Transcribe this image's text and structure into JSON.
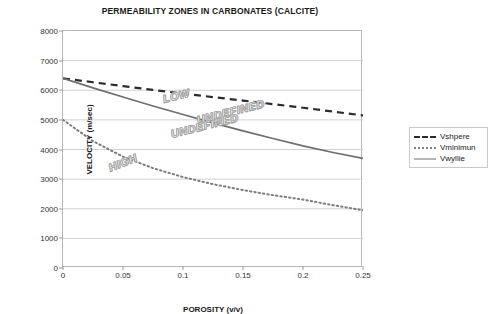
{
  "chart_data": {
    "type": "line",
    "title": "PERMEABILITY ZONES IN CARBONATES (CALCITE)",
    "xlabel": "POROSITY (v/v)",
    "ylabel": "VELOCITY (m/sec)",
    "xlim": [
      0,
      0.25
    ],
    "ylim": [
      0,
      8000
    ],
    "grid": "horizontal",
    "legend_position": "right-outside",
    "xticks": [
      "0",
      "0.05",
      "0.1",
      "0.15",
      "0.2",
      "0.25"
    ],
    "xtick_values": [
      0,
      0.05,
      0.1,
      0.15,
      0.2,
      0.25
    ],
    "yticks": [
      "0",
      "1000",
      "2000",
      "3000",
      "4000",
      "5000",
      "6000",
      "7000",
      "8000"
    ],
    "ytick_values": [
      0,
      1000,
      2000,
      3000,
      4000,
      5000,
      6000,
      7000,
      8000
    ],
    "x": [
      0,
      0.025,
      0.05,
      0.075,
      0.1,
      0.125,
      0.15,
      0.175,
      0.2,
      0.225,
      0.25
    ],
    "series": [
      {
        "name": "Vshpere",
        "style": "dashed",
        "color": "#2b2b2b",
        "values": [
          6400,
          6270,
          6140,
          6010,
          5890,
          5770,
          5650,
          5530,
          5410,
          5280,
          5150
        ]
      },
      {
        "name": "Vminimun",
        "style": "dotted",
        "color": "#7d7d7d",
        "values": [
          5000,
          4280,
          3760,
          3370,
          3070,
          2830,
          2630,
          2460,
          2310,
          2120,
          1950
        ]
      },
      {
        "name": "Vwyllie",
        "style": "solid",
        "color": "#6e6e6e",
        "values": [
          6400,
          6080,
          5770,
          5470,
          5180,
          4900,
          4630,
          4370,
          4120,
          3900,
          3700
        ]
      }
    ],
    "annotations": [
      {
        "text": "LOW",
        "x": 0.083,
        "y": 5720,
        "rotation": -14
      },
      {
        "text": "UNDEFINED",
        "x": 0.112,
        "y": 4980,
        "rotation": -14
      },
      {
        "text": "UNDEFINED",
        "x": 0.09,
        "y": 4520,
        "rotation": -14
      },
      {
        "text": "HIGH",
        "x": 0.038,
        "y": 3370,
        "rotation": -22
      }
    ]
  },
  "legend": {
    "items": [
      {
        "label": "Vshpere"
      },
      {
        "label": "Vminimun"
      },
      {
        "label": "Vwyllie"
      }
    ]
  }
}
